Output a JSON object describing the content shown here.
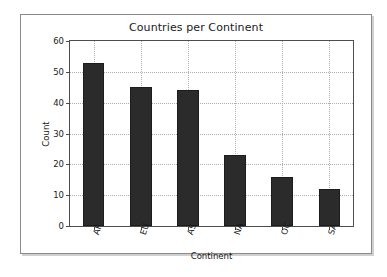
{
  "figure": {
    "background_color": "#ffffff",
    "border_color": "#8a8a8a"
  },
  "chart_data": {
    "type": "bar",
    "title": "Countries per Continent",
    "xlabel": "Continent",
    "ylabel": "Count",
    "categories": [
      "AF",
      "EU",
      "AS",
      "NA",
      "OC",
      "SA"
    ],
    "values": [
      53,
      45,
      44,
      23,
      16,
      12
    ],
    "ylim": [
      0,
      60
    ],
    "yticks": [
      0,
      10,
      20,
      30,
      40,
      50,
      60
    ],
    "ytick_labels": [
      "0",
      "10",
      "20",
      "30",
      "40",
      "50",
      "60"
    ],
    "grid": true,
    "grid_style": "dotted",
    "legend": null,
    "bar_color": "#2b2b2b",
    "bar_edge_color": "#1c1c1c",
    "xtick_rotation": -72
  }
}
